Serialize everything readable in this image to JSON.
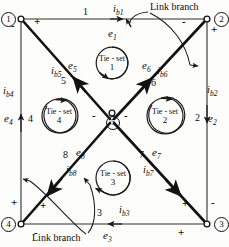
{
  "figure": {
    "type": "electrical-network-graph"
  },
  "nodes": [
    {
      "id": "1",
      "label": "1",
      "x": 21,
      "y": 19
    },
    {
      "id": "2",
      "label": "2",
      "x": 207,
      "y": 19
    },
    {
      "id": "3",
      "label": "3",
      "x": 207,
      "y": 224
    },
    {
      "id": "4",
      "label": "4",
      "x": 21,
      "y": 224
    },
    {
      "id": "5",
      "label": "5",
      "x": 112,
      "y": 121
    }
  ],
  "branches": [
    {
      "number": "1",
      "voltage": "e",
      "voltage_sub": "1",
      "current": "i",
      "current_sub": "b1",
      "from": "1",
      "to": "2",
      "orientation": "left-to-right"
    },
    {
      "number": "2",
      "voltage": "e",
      "voltage_sub": "2",
      "current": "i",
      "current_sub": "b2",
      "from": "2",
      "to": "3",
      "orientation": "top-to-bottom"
    },
    {
      "number": "3",
      "voltage": "e",
      "voltage_sub": "3",
      "current": "i",
      "current_sub": "b3",
      "from": "3",
      "to": "4",
      "orientation": "right-to-left"
    },
    {
      "number": "4",
      "voltage": "e",
      "voltage_sub": "4",
      "current": "i",
      "current_sub": "b4",
      "from": "4",
      "to": "1",
      "orientation": "bottom-to-top"
    },
    {
      "number": "5",
      "voltage": "e",
      "voltage_sub": "5",
      "current": "i",
      "current_sub": "b5",
      "from": "5",
      "to": "1",
      "orientation": "diagonal-up-left"
    },
    {
      "number": "6",
      "voltage": "e",
      "voltage_sub": "6",
      "current": "i",
      "current_sub": "b6",
      "from": "5",
      "to": "2",
      "orientation": "diagonal-up-right"
    },
    {
      "number": "7",
      "voltage": "e",
      "voltage_sub": "7",
      "current": "i",
      "current_sub": "b7",
      "from": "5",
      "to": "3",
      "orientation": "diagonal-down-right"
    },
    {
      "number": "8",
      "voltage": "e",
      "voltage_sub": "8",
      "current": "i",
      "current_sub": "b8",
      "from": "5",
      "to": "4",
      "orientation": "diagonal-down-left"
    }
  ],
  "tiesets": [
    {
      "id": "1",
      "title": "Tie - set",
      "number": "1",
      "cx": 112,
      "cy": 63,
      "r": 16,
      "sense": "clockwise"
    },
    {
      "id": "2",
      "title": "Tie - set",
      "number": "2",
      "cx": 165,
      "cy": 116,
      "r": 18,
      "sense": "clockwise"
    },
    {
      "id": "3",
      "title": "Tie - set",
      "number": "3",
      "cx": 113,
      "cy": 178,
      "r": 17,
      "sense": "counter-clockwise"
    },
    {
      "id": "4",
      "title": "Tie - set",
      "number": "4",
      "cx": 59,
      "cy": 116,
      "r": 17,
      "sense": "clockwise"
    }
  ],
  "polarity_marks": [
    {
      "sign": "-",
      "x": 14,
      "y": 26,
      "for": "branch-4-at-node-1"
    },
    {
      "sign": "+",
      "x": 37,
      "y": 22,
      "for": "branch-1-at-node-1"
    },
    {
      "sign": "-",
      "x": 184,
      "y": 22,
      "for": "branch-1-at-node-2"
    },
    {
      "sign": "+",
      "x": 211,
      "y": 30,
      "for": "branch-2-at-node-2"
    },
    {
      "sign": "-",
      "x": 211,
      "y": 203,
      "for": "branch-2-at-node-3"
    },
    {
      "sign": "+",
      "x": 184,
      "y": 205,
      "for": "branch-7-at-node-3"
    },
    {
      "sign": "+",
      "x": 180,
      "y": 233,
      "for": "branch-3-at-node-3"
    },
    {
      "sign": "-",
      "x": 37,
      "y": 233,
      "for": "branch-3-at-node-4"
    },
    {
      "sign": "+",
      "x": 14,
      "y": 203,
      "for": "branch-4-at-node-4"
    },
    {
      "sign": "+",
      "x": 42,
      "y": 206,
      "for": "branch-8-at-node-4"
    },
    {
      "sign": "-",
      "x": 94,
      "y": 116,
      "for": "branch-5-at-node-5"
    },
    {
      "sign": "-",
      "x": 126,
      "y": 116,
      "for": "branch-6-at-node-5"
    }
  ],
  "callouts": [
    {
      "text": "Link branch",
      "x": 147,
      "y": 4,
      "points_to": "branch-6"
    },
    {
      "text": "Link branch",
      "x": 32,
      "y": 233,
      "points_to": "branch-8"
    }
  ],
  "colors": {
    "ink": "#0b0b0b",
    "thin_line": "#3a3a3a",
    "background": "#fdfdfb"
  }
}
